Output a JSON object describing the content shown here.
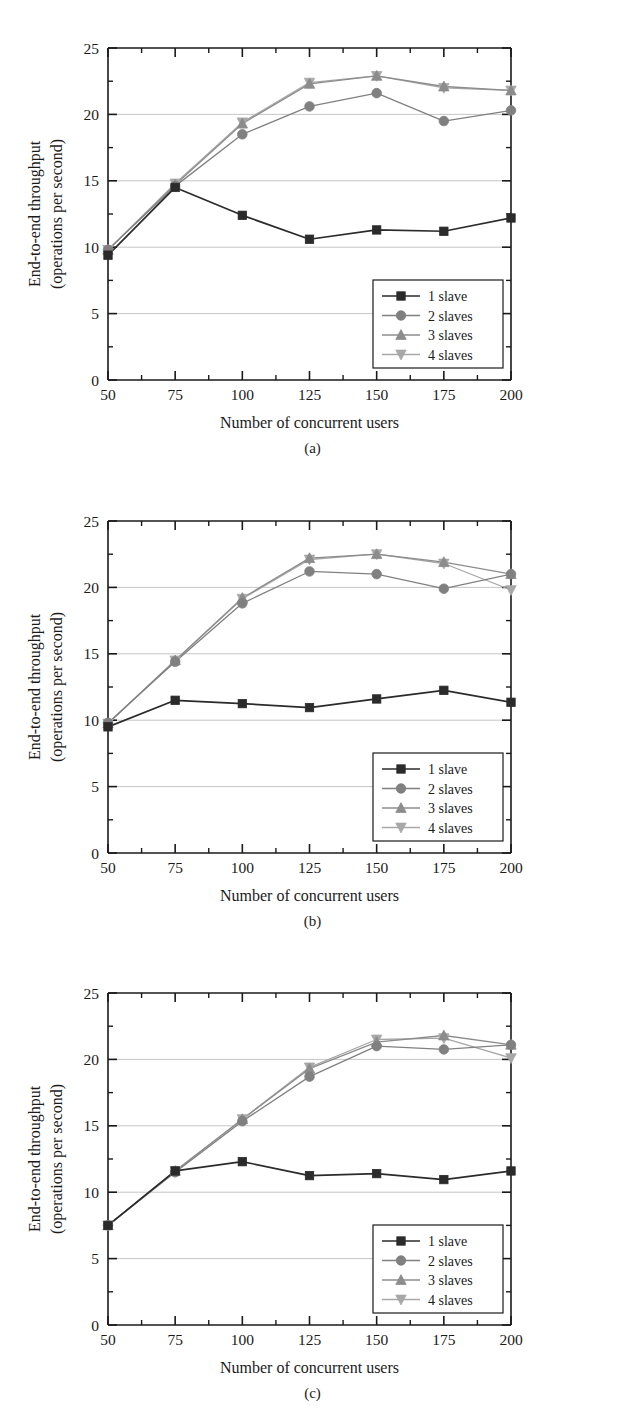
{
  "figure": {
    "panels": [
      {
        "caption": "(a)",
        "xlabel": "Number of concurrent users",
        "ylabel_line1": "End-to-end throughput",
        "ylabel_line2": "(operations per second)",
        "xticks": [
          "50",
          "75",
          "100",
          "125",
          "150",
          "175",
          "200"
        ],
        "yticks": [
          "0",
          "5",
          "10",
          "15",
          "20",
          "25"
        ],
        "legend": [
          "1 slave",
          "2 slaves",
          "3 slaves",
          "4 slaves"
        ]
      },
      {
        "caption": "(b)",
        "xlabel": "Number of concurrent users",
        "ylabel_line1": "End-to-end throughput",
        "ylabel_line2": "(operations per second)",
        "xticks": [
          "50",
          "75",
          "100",
          "125",
          "150",
          "175",
          "200"
        ],
        "yticks": [
          "0",
          "5",
          "10",
          "15",
          "20",
          "25"
        ],
        "legend": [
          "1 slave",
          "2 slaves",
          "3 slaves",
          "4 slaves"
        ]
      },
      {
        "caption": "(c)",
        "xlabel": "Number of concurrent users",
        "ylabel_line1": "End-to-end throughput",
        "ylabel_line2": "(operations per second)",
        "xticks": [
          "50",
          "75",
          "100",
          "125",
          "150",
          "175",
          "200"
        ],
        "yticks": [
          "0",
          "5",
          "10",
          "15",
          "20",
          "25"
        ],
        "legend": [
          "1 slave",
          "2 slaves",
          "3 slaves",
          "4 slaves"
        ]
      }
    ]
  },
  "colors": {
    "series_1_slave": "#2b2b2b",
    "series_2_slaves": "#808080",
    "series_3_slaves": "#8c8c8c",
    "series_4_slaves": "#a8a8a8",
    "grid": "#bfbfbf",
    "axis": "#1a1a1a",
    "background": "#ffffff"
  },
  "chart_data": [
    {
      "type": "line",
      "title": "(a)",
      "xlabel": "Number of concurrent users",
      "ylabel": "End-to-end throughput (operations per second)",
      "x": [
        50,
        75,
        100,
        125,
        150,
        175,
        200
      ],
      "xlim": [
        50,
        200
      ],
      "ylim": [
        0,
        25
      ],
      "xticks": [
        50,
        75,
        100,
        125,
        150,
        175,
        200
      ],
      "yticks": [
        0,
        5,
        10,
        15,
        20,
        25
      ],
      "grid": "horizontal",
      "legend_position": "lower-right",
      "series": [
        {
          "name": "1 slave",
          "marker": "square",
          "color": "#2b2b2b",
          "values": [
            9.4,
            14.5,
            12.4,
            10.6,
            11.3,
            11.2,
            12.2
          ]
        },
        {
          "name": "2 slaves",
          "marker": "circle",
          "color": "#808080",
          "values": [
            9.8,
            14.6,
            18.5,
            20.6,
            21.6,
            19.5,
            20.3
          ]
        },
        {
          "name": "3 slaves",
          "marker": "triangle-up",
          "color": "#8c8c8c",
          "values": [
            9.8,
            14.7,
            19.3,
            22.3,
            22.9,
            22.1,
            21.8
          ]
        },
        {
          "name": "4 slaves",
          "marker": "triangle-down",
          "color": "#a8a8a8",
          "values": [
            9.8,
            14.8,
            19.4,
            22.4,
            22.9,
            22.0,
            21.8
          ]
        }
      ]
    },
    {
      "type": "line",
      "title": "(b)",
      "xlabel": "Number of concurrent users",
      "ylabel": "End-to-end throughput (operations per second)",
      "x": [
        50,
        75,
        100,
        125,
        150,
        175,
        200
      ],
      "xlim": [
        50,
        200
      ],
      "ylim": [
        0,
        25
      ],
      "xticks": [
        50,
        75,
        100,
        125,
        150,
        175,
        200
      ],
      "yticks": [
        0,
        5,
        10,
        15,
        20,
        25
      ],
      "grid": "horizontal",
      "legend_position": "lower-right",
      "series": [
        {
          "name": "1 slave",
          "marker": "square",
          "color": "#2b2b2b",
          "values": [
            9.5,
            11.5,
            11.25,
            10.95,
            11.6,
            12.25,
            11.35
          ]
        },
        {
          "name": "2 slaves",
          "marker": "circle",
          "color": "#808080",
          "values": [
            9.8,
            14.4,
            18.8,
            21.2,
            21.0,
            19.9,
            21.0
          ]
        },
        {
          "name": "3 slaves",
          "marker": "triangle-up",
          "color": "#8c8c8c",
          "values": [
            9.75,
            14.5,
            19.2,
            22.2,
            22.5,
            21.9,
            21.0
          ]
        },
        {
          "name": "4 slaves",
          "marker": "triangle-down",
          "color": "#a8a8a8",
          "values": [
            9.75,
            14.5,
            19.15,
            22.1,
            22.5,
            21.8,
            19.8
          ]
        }
      ]
    },
    {
      "type": "line",
      "title": "(c)",
      "xlabel": "Number of concurrent users",
      "ylabel": "End-to-end throughput (operations per second)",
      "x": [
        50,
        75,
        100,
        125,
        150,
        175,
        200
      ],
      "xlim": [
        50,
        200
      ],
      "ylim": [
        0,
        25
      ],
      "xticks": [
        50,
        75,
        100,
        125,
        150,
        175,
        200
      ],
      "yticks": [
        0,
        5,
        10,
        15,
        20,
        25
      ],
      "grid": "horizontal",
      "legend_position": "lower-right",
      "series": [
        {
          "name": "1 slave",
          "marker": "square",
          "color": "#2b2b2b",
          "values": [
            7.5,
            11.6,
            12.3,
            11.25,
            11.4,
            10.95,
            11.6
          ]
        },
        {
          "name": "2 slaves",
          "marker": "circle",
          "color": "#808080",
          "values": [
            7.5,
            11.5,
            15.35,
            18.7,
            21.0,
            20.75,
            21.1
          ]
        },
        {
          "name": "3 slaves",
          "marker": "triangle-up",
          "color": "#8c8c8c",
          "values": [
            7.5,
            11.6,
            15.5,
            19.3,
            21.3,
            21.8,
            21.1
          ]
        },
        {
          "name": "4 slaves",
          "marker": "triangle-down",
          "color": "#a8a8a8",
          "values": [
            7.5,
            11.6,
            15.5,
            19.4,
            21.5,
            21.6,
            20.1
          ]
        }
      ]
    }
  ]
}
